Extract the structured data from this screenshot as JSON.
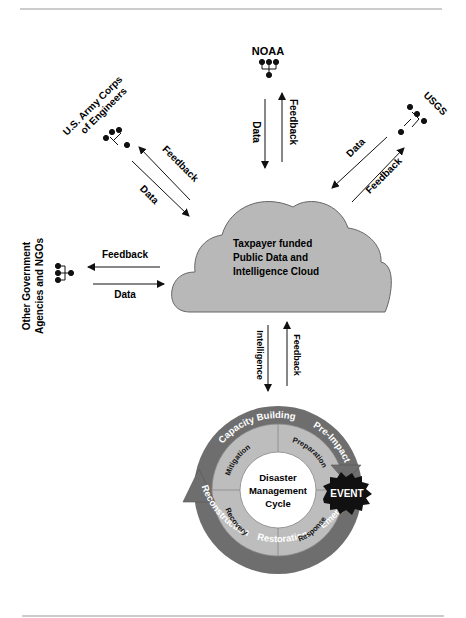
{
  "diagram": {
    "colors": {
      "cloud_fill": "#b8b8b8",
      "cloud_stroke": "#666666",
      "outer_ring": "#6e6e6e",
      "inner_ring": "#bdbdbd",
      "center": "#ffffff",
      "event_fill": "#111111",
      "rule": "#999999"
    },
    "cloud": {
      "line1": "Taxpayer funded",
      "line2": "Public Data and",
      "line3": "Intelligence Cloud"
    },
    "nodes": {
      "noaa": {
        "label": "NOAA",
        "out": "Data",
        "in": "Feedback"
      },
      "usace": {
        "label1": "U.S. Army Corps",
        "label2": "of Engineers",
        "out": "Data",
        "in": "Feedback"
      },
      "usgs": {
        "label": "USGS",
        "out": "Data",
        "in": "Feedback"
      },
      "other": {
        "label1": "Other Government",
        "label2": "Agencies and NGOs",
        "out": "Data",
        "in": "Feedback"
      }
    },
    "cloud_to_cycle": {
      "down": "Intelligence",
      "up": "Feedback"
    },
    "cycle": {
      "center1": "Disaster",
      "center2": "Management",
      "center3": "Cycle",
      "quadrants": [
        "Mitigation",
        "Preparation",
        "Response",
        "Recovery"
      ],
      "outer": [
        "Capacity Building",
        "Pre-Impact",
        "Emergency",
        "Restoration",
        "Reconstruction"
      ],
      "event": "EVENT"
    }
  }
}
